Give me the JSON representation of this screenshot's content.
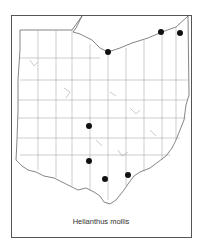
{
  "map": {
    "region": "Ohio",
    "subdivision": "counties",
    "caption": "Helianthus mollis",
    "colors": {
      "border": "#555555",
      "county_lines": "#888888",
      "dots": "#111111",
      "background": "#ffffff"
    },
    "occurrence_dots": [
      {
        "x": 108,
        "y": 52
      },
      {
        "x": 161,
        "y": 32
      },
      {
        "x": 180,
        "y": 33
      },
      {
        "x": 89,
        "y": 126
      },
      {
        "x": 89,
        "y": 161
      },
      {
        "x": 105,
        "y": 179
      },
      {
        "x": 128,
        "y": 175
      }
    ]
  }
}
